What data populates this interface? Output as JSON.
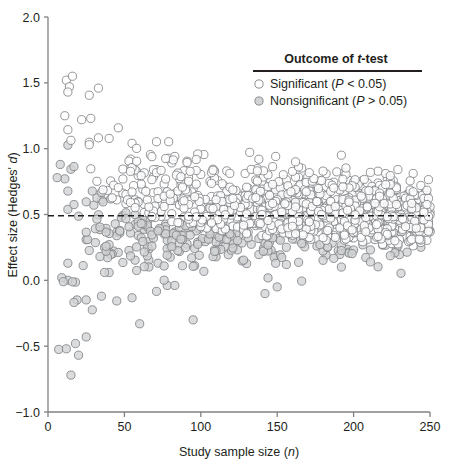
{
  "chart_data": {
    "type": "scatter",
    "title": "",
    "xlabel": "Study sample size (n)",
    "ylabel": "Effect size (Hedges' d)",
    "xlim": [
      0,
      250
    ],
    "ylim": [
      -1.0,
      2.0
    ],
    "xticks": [
      0,
      50,
      100,
      150,
      200,
      250
    ],
    "yticks": [
      -1.0,
      -0.5,
      0.0,
      0.5,
      1.0,
      1.5,
      2.0
    ],
    "xtick_labels": [
      "0",
      "50",
      "100",
      "150",
      "200",
      "250"
    ],
    "ytick_labels": [
      "−1.0",
      "−0.5",
      "0.0",
      "0.5",
      "1.0",
      "1.5",
      "2.0"
    ],
    "grid": false,
    "reference_line": {
      "orientation": "horizontal",
      "value": 0.49,
      "style": "dashed",
      "label": ""
    },
    "series": [
      {
        "name": "Significant (P < 0.05)",
        "marker": "open-circle",
        "fill": "#ffffff",
        "stroke": "#808285",
        "n_points": 790
      },
      {
        "name": "Nonsignificant (P > 0.05)",
        "marker": "filled-circle",
        "fill": "#d1d3d4",
        "stroke": "#808285",
        "n_points": 510
      }
    ],
    "generator": {
      "description": "Simulated meta-analytic funnel plot: true effect delta = 0.5; each study draws n from a right-skewed distribution on [5,250] and observes d ~ Normal(delta, se) with se = sqrt(4/n + d^2/(2n)); significance by two-sample t-test at alpha = 0.05 (|d| > 1.96*se).",
      "true_effect": 0.5,
      "alpha": 0.05,
      "n_min": 5,
      "n_max": 250,
      "total_points": 1300,
      "seed": 20240517
    },
    "annotations": [
      {
        "text": "high-effect outliers occur only at small n",
        "x": 15,
        "y": 1.55
      },
      {
        "text": "lowest outlier",
        "x": 15,
        "y": -0.72
      }
    ]
  },
  "axes": {
    "x_title_main": "Study sample size (",
    "x_title_italic": "n",
    "x_title_end": ")",
    "y_title_main": "Effect size (Hedges' ",
    "y_title_italic": "d",
    "y_title_end": ")"
  },
  "legend": {
    "title_main": "Outcome of ",
    "title_italic": "t",
    "title_end": "-test",
    "items": [
      {
        "label_main": "Significant (",
        "label_italic": "P",
        "label_end": " < 0.05)",
        "marker_fill": "#ffffff",
        "marker_stroke": "#808285"
      },
      {
        "label_main": "Nonsignificant (",
        "label_italic": "P",
        "label_end": " > 0.05)",
        "marker_fill": "#d1d3d4",
        "marker_stroke": "#808285"
      }
    ]
  },
  "colors": {
    "axis": "#808285",
    "text": "#231f20",
    "marker_stroke": "#808285",
    "marker_fill_significant": "#ffffff",
    "marker_fill_nonsignificant": "#d1d3d4",
    "reference_line": "#231f20",
    "legend_rule": "#231f20"
  }
}
